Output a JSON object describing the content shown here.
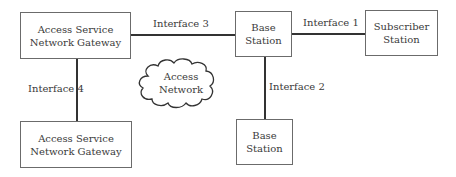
{
  "diagram": {
    "nodes": {
      "asn_gw_top": {
        "line1": "Access Service",
        "line2": "Network Gateway"
      },
      "bs_top": {
        "line1": "Base",
        "line2": "Station"
      },
      "subscriber": {
        "line1": "Subscriber",
        "line2": "Station"
      },
      "asn_gw_bottom": {
        "line1": "Access Service",
        "line2": "Network Gateway"
      },
      "bs_bottom": {
        "line1": "Base",
        "line2": "Station"
      },
      "cloud": {
        "line1": "Access",
        "line2": "Network"
      }
    },
    "edges": {
      "interface1": "Interface 1",
      "interface2": "Interface 2",
      "interface3": "Interface 3",
      "interface4": "Interface 4"
    },
    "connections": [
      {
        "from": "Access Service Network Gateway (top)",
        "to": "Base Station (top)",
        "label": "Interface 3"
      },
      {
        "from": "Base Station (top)",
        "to": "Subscriber Station",
        "label": "Interface 1"
      },
      {
        "from": "Base Station (top)",
        "to": "Base Station (bottom)",
        "label": "Interface 2"
      },
      {
        "from": "Access Service Network Gateway (top)",
        "to": "Access Service Network Gateway (bottom)",
        "label": "Interface 4"
      }
    ]
  }
}
